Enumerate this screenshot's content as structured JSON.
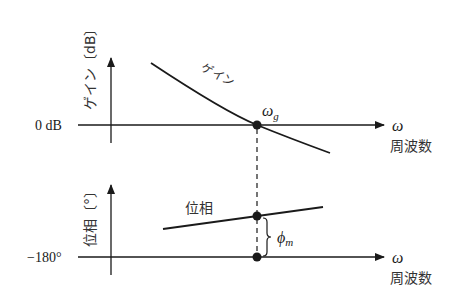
{
  "diagram": {
    "type": "bode-plot-phase-margin",
    "colors": {
      "line": "#1a1a1a",
      "background": "#ffffff"
    },
    "gain_plot": {
      "y_axis_label": "ゲイン〔dB〕",
      "zero_label": "0 dB",
      "x_axis_symbol": "ω",
      "x_axis_label": "周波数",
      "curve_label": "ゲイン",
      "crossover_label": "ω",
      "crossover_subscript": "g"
    },
    "phase_plot": {
      "y_axis_label": "位相〔°〕",
      "ref_label": "−180°",
      "x_axis_symbol": "ω",
      "x_axis_label": "周波数",
      "curve_label": "位相",
      "margin_label": "ϕ",
      "margin_subscript": "m"
    }
  }
}
